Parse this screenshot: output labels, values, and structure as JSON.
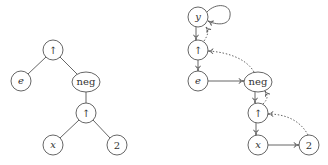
{
  "diagrams": {
    "tree": {
      "nodes": [
        {
          "id": "t_up1",
          "label": "↑"
        },
        {
          "id": "t_e",
          "label": "e"
        },
        {
          "id": "t_neg",
          "label": "neg"
        },
        {
          "id": "t_up2",
          "label": "↑"
        },
        {
          "id": "t_x",
          "label": "x"
        },
        {
          "id": "t_2",
          "label": "2"
        }
      ],
      "edges": [
        [
          "t_up1",
          "t_e"
        ],
        [
          "t_up1",
          "t_neg"
        ],
        [
          "t_neg",
          "t_up2"
        ],
        [
          "t_up2",
          "t_x"
        ],
        [
          "t_up2",
          "t_2"
        ]
      ]
    },
    "graph": {
      "nodes": [
        {
          "id": "g_y",
          "label": "y"
        },
        {
          "id": "g_up1",
          "label": "↑"
        },
        {
          "id": "g_e",
          "label": "e"
        },
        {
          "id": "g_neg",
          "label": "neg"
        },
        {
          "id": "g_up2",
          "label": "↑"
        },
        {
          "id": "g_x",
          "label": "x"
        },
        {
          "id": "g_2",
          "label": "2"
        }
      ],
      "solid_edges": [
        [
          "g_y",
          "g_y"
        ],
        [
          "g_y",
          "g_up1"
        ],
        [
          "g_up1",
          "g_e"
        ],
        [
          "g_e",
          "g_neg"
        ],
        [
          "g_neg",
          "g_up2"
        ],
        [
          "g_up2",
          "g_x"
        ],
        [
          "g_x",
          "g_2"
        ]
      ],
      "dotted_edges": [
        [
          "g_up1",
          "g_y"
        ],
        [
          "g_neg",
          "g_up1"
        ],
        [
          "g_up2",
          "g_neg"
        ],
        [
          "g_2",
          "g_up2"
        ]
      ]
    }
  }
}
